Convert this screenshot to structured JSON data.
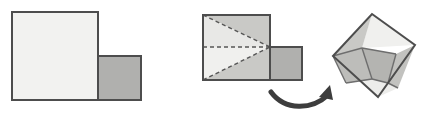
{
  "figure": {
    "canvas": {
      "width": 428,
      "height": 124,
      "background": "#ffffff"
    },
    "colors": {
      "light_fill": "#f2f2f0",
      "mid_fill": "#d9d9d6",
      "gray_fill": "#b0b0ae",
      "dark_gray_fill": "#a8a8a6",
      "outline": "#4d4d4d",
      "outline_soft": "#6e6e6e",
      "dashed_line": "#555555",
      "arrow": "#3d3d3d"
    },
    "stroke_widths": {
      "outline": 2,
      "inner": 1.4,
      "dashed": 1.4
    },
    "dash_pattern": "4,3",
    "panels": [
      {
        "name": "source-shape",
        "label": "L-shape formed by a large square and a small square",
        "parts": [
          {
            "name": "large-square",
            "points": "12,12 98,12 98,100 12,100",
            "fill": "#f2f2f0"
          },
          {
            "name": "small-square",
            "points": "98,56 141,56 141,100 98,100",
            "fill": "#b0b0ae"
          }
        ]
      },
      {
        "name": "cut-shape",
        "label": "Same L-shape with dashed cut lines converging at the notch corner",
        "parts": [
          {
            "name": "upper-triangle-piece",
            "points": "203,15 270,15 270,47",
            "fill": "#c9c9c6"
          },
          {
            "name": "middle-left-triangle-piece",
            "points": "203,15 270,47 203,47",
            "fill": "#e8e8e6"
          },
          {
            "name": "lower-left-triangle-piece",
            "points": "203,47 270,47 203,80",
            "fill": "#f0f0ee"
          },
          {
            "name": "lower-triangle-piece",
            "points": "203,80 270,47 270,80",
            "fill": "#c9c9c6"
          },
          {
            "name": "small-square-piece",
            "points": "270,47 302,47 302,80 270,80",
            "fill": "#b0b0ae"
          }
        ],
        "cuts": [
          {
            "name": "cut-top-diagonal",
            "x1": 203,
            "y1": 15,
            "x2": 270,
            "y2": 47
          },
          {
            "name": "cut-horizontal-midline",
            "x1": 203,
            "y1": 47,
            "x2": 270,
            "y2": 47
          },
          {
            "name": "cut-bottom-diagonal",
            "x1": 203,
            "y1": 80,
            "x2": 270,
            "y2": 47
          }
        ],
        "outlines": [
          {
            "name": "large-square-outline",
            "points": "203,15 270,15 270,80 203,80"
          },
          {
            "name": "small-square-outline",
            "points": "270,47 302,47 302,80 270,80"
          }
        ]
      },
      {
        "name": "result-shape",
        "label": "Pieces reassembled into one tilted square",
        "vertices": {
          "top": [
            372,
            14
          ],
          "right": [
            415,
            45
          ],
          "bottom": [
            378,
            97
          ],
          "left": [
            333,
            56
          ]
        },
        "parts": [
          {
            "name": "result-top-triangle",
            "points": "372,14 415,45 362,48",
            "fill": "#f0f0ee"
          },
          {
            "name": "result-upper-left-piece",
            "points": "372,14 362,48 333,56",
            "fill": "#c9c9c6"
          },
          {
            "name": "result-left-piece",
            "points": "333,56 362,48 372,79 346,83",
            "fill": "#bdbdba"
          },
          {
            "name": "result-center-square",
            "points": "362,48 396,54 388,83 372,79",
            "fill": "#b4b4b1"
          },
          {
            "name": "result-right-piece",
            "points": "396,54 415,45 398,88 388,83",
            "fill": "#c2c2bf"
          },
          {
            "name": "result-bottom-triangle",
            "points": "346,83 372,79 388,83 398,88 378,97 333,56",
            "fill": "#ededeb"
          }
        ],
        "inner_lines": [
          {
            "name": "result-inner-line-1",
            "x1": 362,
            "y1": 48,
            "x2": 396,
            "y2": 54
          },
          {
            "name": "result-inner-line-2",
            "x1": 362,
            "y1": 48,
            "x2": 372,
            "y2": 79
          },
          {
            "name": "result-inner-line-3",
            "x1": 372,
            "y1": 79,
            "x2": 388,
            "y2": 83
          },
          {
            "name": "result-inner-line-4",
            "x1": 396,
            "y1": 54,
            "x2": 388,
            "y2": 83
          },
          {
            "name": "result-inner-line-5",
            "x1": 333,
            "y1": 56,
            "x2": 362,
            "y2": 48
          },
          {
            "name": "result-inner-line-6",
            "x1": 346,
            "y1": 83,
            "x2": 372,
            "y2": 79
          },
          {
            "name": "result-inner-line-7",
            "x1": 333,
            "y1": 56,
            "x2": 346,
            "y2": 83
          },
          {
            "name": "result-inner-line-8",
            "x1": 388,
            "y1": 83,
            "x2": 398,
            "y2": 88
          }
        ],
        "outline_points": "372,14 415,45 378,97 333,56"
      }
    ],
    "arrow": {
      "name": "transform-arrow",
      "label": "curved arrow indicating rearrangement",
      "path": "M 271,92 C 285,111 312,110 328,95",
      "head": "330,85 333,100 319,97",
      "color": "#3d3d3d",
      "width": 5
    }
  }
}
